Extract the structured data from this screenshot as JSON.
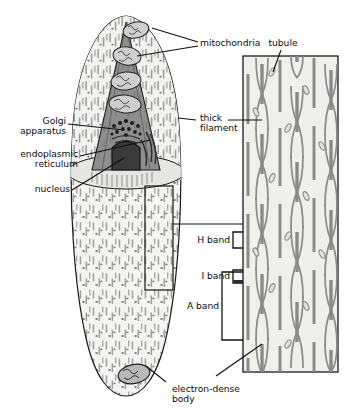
{
  "figure": {
    "type": "biological-diagram",
    "colors": {
      "outline": "#1a1a1a",
      "cytoplasm": "#f2f2f0",
      "cone_fill": "#8c8c8c",
      "nucleus_fill": "#3d3d3d",
      "organelle_outline": "#2b2b2b",
      "filament_gray": "#8a8a8a",
      "panel_fill": "#efefec",
      "dash_gray": "#9a9a9a",
      "label_text": "#0d0d0d"
    }
  },
  "labels": {
    "mitochondria": "mitochondria",
    "golgi_line1": "Golgi",
    "golgi_line2": "apparatus",
    "er_line1": "endoplasmic",
    "er_line2": "reticulum",
    "nucleus": "nucleus",
    "thick_filament_line1": "thick",
    "thick_filament_line2": "filament",
    "tubule": "tubule",
    "h_band": "H band",
    "i_band": "I band",
    "a_band": "A band",
    "electron_dense_line1": "electron-dense",
    "electron_dense_line2": "body"
  },
  "structures": {
    "cell": {
      "name": "smooth-muscle-cell",
      "shape": "elongated spindle / fusiform",
      "texture": "vertical dashes and dots representing myofilaments"
    },
    "cutaway_cone": {
      "name": "cutaway-cone",
      "description": "wedge cut revealing interior organelles"
    },
    "mitochondria_count": 5,
    "golgi": {
      "name": "golgi-apparatus",
      "description": "cluster of dots and short curved cisternae"
    },
    "nucleus": {
      "name": "nucleus",
      "description": "dark dome-shaped body at base of cutaway"
    },
    "electron_dense_body": {
      "name": "electron-dense-body",
      "description": "dark oval body near lower cell tip"
    },
    "inset_rectangle": {
      "name": "inset-region",
      "description": "boxed region of cytoplasm magnified in the right panel"
    },
    "panel": {
      "name": "magnified-filament-panel",
      "description": "magnified view showing thick filaments, tubules and band regions"
    }
  },
  "bands": [
    {
      "id": "h-band",
      "label": "H band",
      "bracket": "small"
    },
    {
      "id": "i-band",
      "label": "I band",
      "bracket": "small"
    },
    {
      "id": "a-band",
      "label": "A band",
      "bracket": "large"
    }
  ]
}
